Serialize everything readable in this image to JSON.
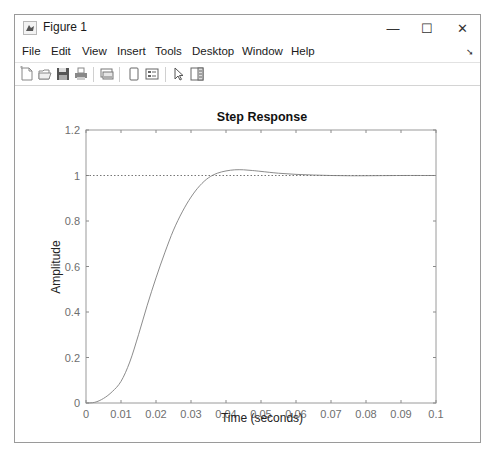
{
  "window": {
    "title": "Figure 1",
    "controls": {
      "minimize": "—",
      "maximize": "☐",
      "close": "✕"
    }
  },
  "menubar": {
    "items": [
      {
        "label": "File"
      },
      {
        "label": "Edit"
      },
      {
        "label": "View"
      },
      {
        "label": "Insert"
      },
      {
        "label": "Tools"
      },
      {
        "label": "Desktop"
      },
      {
        "label": "Window"
      },
      {
        "label": "Help"
      }
    ],
    "dock_arrow": "➘"
  },
  "toolbar": {
    "buttons": [
      {
        "name": "new-figure",
        "icon": "new-file-icon"
      },
      {
        "name": "open-file",
        "icon": "open-folder-icon"
      },
      {
        "name": "save-figure",
        "icon": "save-icon"
      },
      {
        "name": "print-figure",
        "icon": "print-icon"
      },
      {
        "name": "link-plot",
        "icon": "link-plot-icon"
      },
      {
        "name": "hide-plot-tools",
        "icon": "hide-plot-tools-icon"
      },
      {
        "name": "show-plot-tools",
        "icon": "show-plot-tools-icon"
      },
      {
        "name": "edit-plot",
        "icon": "pointer-arrow-icon"
      },
      {
        "name": "property-inspector",
        "icon": "property-inspector-icon"
      }
    ]
  },
  "chart_data": {
    "type": "line",
    "title": "Step Response",
    "xlabel": "Time (seconds)",
    "ylabel": "Amplitude",
    "xlim": [
      0,
      0.1
    ],
    "ylim": [
      0,
      1.2
    ],
    "xticks": [
      0,
      0.01,
      0.02,
      0.03,
      0.04,
      0.05,
      0.06,
      0.07,
      0.08,
      0.09,
      0.1
    ],
    "xtick_labels": [
      "0",
      "0.01",
      "0.02",
      "0.03",
      "0.04",
      "0.05",
      "0.06",
      "0.07",
      "0.08",
      "0.09",
      "0.1"
    ],
    "yticks": [
      0,
      0.2,
      0.4,
      0.6,
      0.8,
      1,
      1.2
    ],
    "ytick_labels": [
      "0",
      "0.2",
      "0.4",
      "0.6",
      "0.8",
      "1",
      "1.2"
    ],
    "grid": false,
    "legend": null,
    "series": [
      {
        "name": "step response",
        "color": "#8c8c8c",
        "style": "solid",
        "x": [
          0,
          0.0025,
          0.005,
          0.0075,
          0.01,
          0.0125,
          0.015,
          0.0175,
          0.02,
          0.0225,
          0.025,
          0.0275,
          0.03,
          0.0325,
          0.035,
          0.0375,
          0.04,
          0.0425,
          0.045,
          0.0475,
          0.05,
          0.055,
          0.06,
          0.065,
          0.07,
          0.075,
          0.08,
          0.09,
          0.1
        ],
        "values": [
          0,
          0.003,
          0.02,
          0.05,
          0.095,
          0.18,
          0.3,
          0.43,
          0.55,
          0.66,
          0.76,
          0.84,
          0.905,
          0.955,
          0.99,
          1.01,
          1.02,
          1.025,
          1.025,
          1.022,
          1.018,
          1.01,
          1.005,
          1.002,
          1.0,
          0.999,
          0.999,
          1.0,
          1.0
        ]
      },
      {
        "name": "steady-state",
        "color": "#777777",
        "style": "dotted",
        "x": [
          0,
          0.1
        ],
        "values": [
          1,
          1
        ]
      }
    ]
  }
}
